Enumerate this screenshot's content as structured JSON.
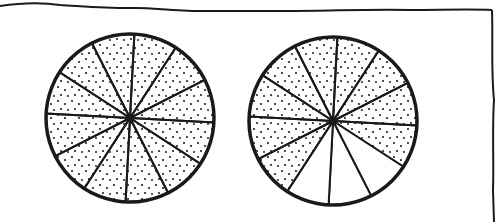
{
  "figure": {
    "stroke_color": "#1a1a1a",
    "background": "#ffffff"
  },
  "wheels": [
    {
      "id": "left",
      "cx": 130,
      "cy": 118,
      "r": 84,
      "sectors": 12,
      "shaded": [
        true,
        true,
        true,
        true,
        true,
        true,
        true,
        true,
        true,
        true,
        true,
        true
      ],
      "shaded_count": 12
    },
    {
      "id": "right",
      "cx": 333,
      "cy": 121,
      "r": 84,
      "sectors": 12,
      "shaded": [
        true,
        true,
        true,
        true,
        false,
        false,
        false,
        true,
        true,
        true,
        true,
        true
      ],
      "shaded_count": 9
    }
  ],
  "caption": {
    "left": "12/12 shaded",
    "right": "9/12 shaded"
  }
}
